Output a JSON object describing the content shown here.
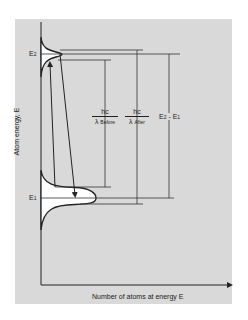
{
  "diagram": {
    "y_axis_label": "Atom energy, E",
    "x_axis_label": "Number of atoms at energy E",
    "levels": {
      "upper": {
        "label": "E",
        "sub": "2"
      },
      "lower": {
        "label": "E",
        "sub": "1"
      }
    },
    "annotations": {
      "before": {
        "numerator": "hc",
        "denominator": "λ",
        "sub": "Before"
      },
      "after": {
        "numerator": "hc",
        "denominator": "λ",
        "sub": "After"
      },
      "difference": {
        "text": "E",
        "sub1": "2",
        "mid": " - E",
        "sub2": "1"
      }
    },
    "colors": {
      "panel": "#d9d9d9",
      "line": "#222222",
      "fill": "#ffffff"
    }
  }
}
